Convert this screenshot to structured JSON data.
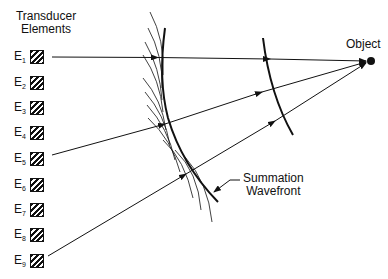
{
  "title_line1": "Transducer",
  "title_line2": "Elements",
  "elements": [
    {
      "label": "E",
      "sub": "1"
    },
    {
      "label": "E",
      "sub": "2"
    },
    {
      "label": "E",
      "sub": "3"
    },
    {
      "label": "E",
      "sub": "4"
    },
    {
      "label": "E",
      "sub": "5"
    },
    {
      "label": "E",
      "sub": "6"
    },
    {
      "label": "E",
      "sub": "7"
    },
    {
      "label": "E",
      "sub": "8"
    },
    {
      "label": "E",
      "sub": "9"
    }
  ],
  "object_label": "Object",
  "wavefront_label_line1": "Summation",
  "wavefront_label_line2": "Wavefront",
  "colors": {
    "ink": "#111111",
    "background": "#ffffff"
  }
}
